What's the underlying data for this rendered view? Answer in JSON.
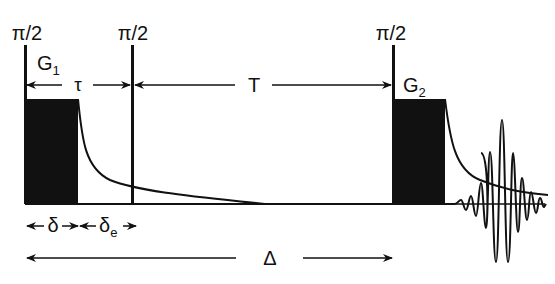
{
  "diagram": {
    "type": "PFG stimulated echo pulse sequence",
    "pulses": [
      {
        "id": "pulse-1",
        "label": "π/2"
      },
      {
        "id": "pulse-2",
        "label": "π/2"
      },
      {
        "id": "pulse-3",
        "label": "π/2"
      }
    ],
    "gradients": [
      {
        "id": "gradient-1",
        "label": "G",
        "subscript": "1"
      },
      {
        "id": "gradient-2",
        "label": "G",
        "subscript": "2"
      }
    ],
    "intervals": {
      "tau": "τ",
      "T": "T",
      "delta": "δ",
      "delta_e": "δ",
      "delta_e_sub": "e",
      "Delta": "Δ"
    },
    "colors": {
      "ink": "#111111",
      "background": "#ffffff"
    }
  }
}
